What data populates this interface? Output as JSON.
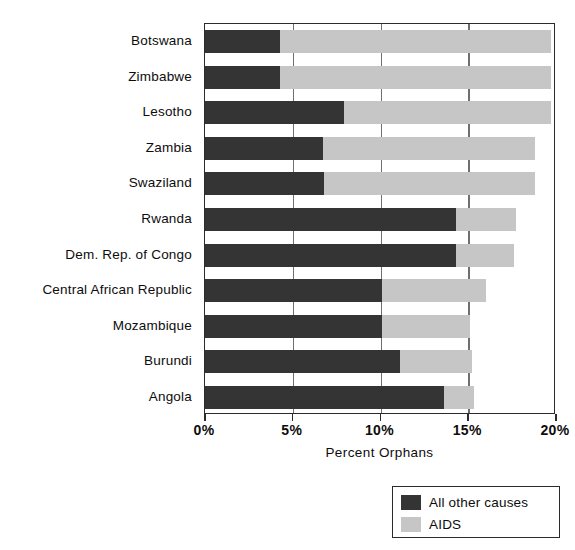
{
  "chart_data": {
    "type": "bar",
    "orientation": "horizontal",
    "stacked": true,
    "title": "",
    "xlabel": "Percent Orphans",
    "ylabel": "",
    "xlim": [
      0,
      20
    ],
    "xtick_labels": [
      "0%",
      "5%",
      "10%",
      "15%",
      "20%"
    ],
    "xtick_values": [
      0,
      5,
      10,
      15,
      20
    ],
    "grid": true,
    "legend_position": "bottom-right",
    "categories": [
      "Botswana",
      "Zimbabwe",
      "Lesotho",
      "Zambia",
      "Swaziland",
      "Rwanda",
      "Dem. Rep. of Congo",
      "Central African Republic",
      "Mozambique",
      "Burundi",
      "Angola"
    ],
    "series": [
      {
        "name": "All other causes",
        "color": "#343434",
        "values": [
          4.3,
          4.3,
          7.9,
          6.7,
          6.8,
          14.3,
          14.3,
          10.1,
          10.1,
          11.1,
          13.6
        ]
      },
      {
        "name": "AIDS",
        "color": "#c6c6c6",
        "values": [
          15.4,
          15.4,
          11.8,
          12.1,
          12.0,
          3.4,
          3.3,
          5.9,
          5.0,
          4.1,
          1.7
        ]
      }
    ],
    "totals": [
      19.7,
      19.7,
      19.7,
      18.8,
      18.8,
      17.7,
      17.6,
      16.0,
      15.1,
      15.2,
      15.3
    ]
  },
  "legend": {
    "entries": [
      {
        "label": "All other causes",
        "color": "#343434"
      },
      {
        "label": "AIDS",
        "color": "#c6c6c6"
      }
    ]
  },
  "colors": {
    "other_causes": "#343434",
    "aids": "#c6c6c6",
    "axis": "#2b2b2b",
    "grid": "#6f6f6f",
    "background": "#ffffff"
  }
}
